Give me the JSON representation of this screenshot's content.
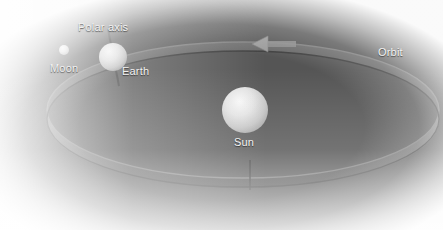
{
  "diagram": {
    "background_color": "#555555",
    "label_color": "#f2f2f2",
    "vignette_color": "#ffffff",
    "labels": {
      "polar_axis": "Polar axis",
      "moon": "Moon",
      "earth": "Earth",
      "sun": "Sun",
      "orbit": "Orbit"
    },
    "bodies": [
      {
        "name": "sun",
        "label": "Sun",
        "cx": 245,
        "cy": 110,
        "r": 23,
        "color": "#d9d9d9",
        "highlight_color": "#f4f4f4"
      },
      {
        "name": "earth",
        "label": "Earth",
        "cx": 113,
        "cy": 57,
        "r": 14,
        "color": "#d2d2d2",
        "highlight_color": "#efefef"
      },
      {
        "name": "moon",
        "label": "Moon",
        "cx": 64,
        "cy": 50,
        "r": 5,
        "color": "#cccccc",
        "highlight_color": "#ededed"
      }
    ],
    "orbit": {
      "label": "Orbit",
      "cx": 243,
      "cy": 110,
      "rx": 196,
      "ry": 68,
      "band_color": "#6e6e6e",
      "band_edge_color": "#3f3f3f",
      "direction": "counter-clockwise",
      "arrow_label": "orbit-direction-arrow",
      "arrow_x": 262,
      "arrow_y": 44,
      "tick_x": 250,
      "tick_y": 175
    },
    "polar_axis": {
      "label": "Polar axis",
      "tilt_degrees": 8,
      "color": "#3a3a3a",
      "x1": 108,
      "y1": 32,
      "x2": 118,
      "y2": 83
    }
  }
}
